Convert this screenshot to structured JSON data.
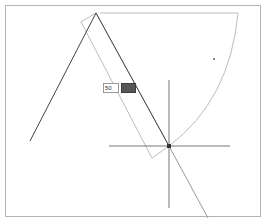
{
  "canvas": {
    "frame_color": "#b4b4b4",
    "background": "#ffffff"
  },
  "drawing": {
    "apex": [
      96,
      13
    ],
    "main_lines": {
      "color": "#444444",
      "left_end": [
        30,
        141
      ],
      "right_end": [
        169,
        146
      ]
    },
    "rotated_rectangle": {
      "color": "#bdbdbd",
      "points": [
        [
          96,
          13
        ],
        [
          81,
          22
        ],
        [
          152,
          158
        ],
        [
          169,
          146
        ]
      ]
    },
    "arc": {
      "color": "#bdbdbd",
      "top_start": [
        100,
        13
      ],
      "top_end": [
        238,
        13
      ],
      "end": [
        169,
        146
      ]
    },
    "crosshair": {
      "color": "#777777",
      "center": [
        169,
        146
      ],
      "h_start": [
        109,
        146
      ],
      "h_end": [
        230,
        146
      ],
      "v_start": [
        169,
        80
      ],
      "v_end": [
        169,
        208
      ]
    },
    "diagonal": {
      "color": "#999999",
      "end": [
        208,
        218
      ]
    },
    "stray_dot": [
      214,
      59
    ]
  },
  "angle_input": {
    "value": "50",
    "button_label": ""
  }
}
